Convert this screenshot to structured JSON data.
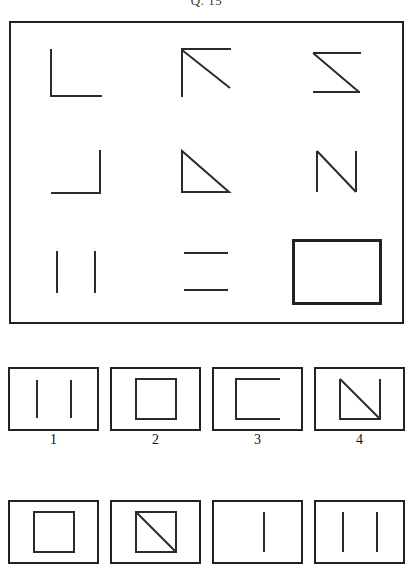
{
  "question": {
    "title": "Q. 15"
  },
  "matrix": {
    "rows": 3,
    "columns": 3,
    "cells": [
      {
        "position": "row1-col1",
        "name": "corner-bottom-left-shape",
        "description": "L shape: left vertical line and bottom horizontal line"
      },
      {
        "position": "row1-col2",
        "name": "corner-top-left-with-diagonal-shape",
        "description": "Left vertical line, top horizontal line and diagonal from top-left to bottom-right"
      },
      {
        "position": "row1-col3",
        "name": "z-shape",
        "description": "Top horizontal line, diagonal from top-left to bottom-right and bottom horizontal line"
      },
      {
        "position": "row2-col1",
        "name": "corner-bottom-right-shape",
        "description": "Right vertical line and bottom horizontal line"
      },
      {
        "position": "row2-col2",
        "name": "right-triangle-shape",
        "description": "Left vertical line, bottom horizontal line and diagonal hypotenuse"
      },
      {
        "position": "row2-col3",
        "name": "n-shape",
        "description": "Left vertical line, diagonal from top-left to bottom-right and right vertical line"
      },
      {
        "position": "row3-col1",
        "name": "two-vertical-lines-shape",
        "description": "Two parallel vertical lines"
      },
      {
        "position": "row3-col2",
        "name": "two-horizontal-lines-shape",
        "description": "Two parallel horizontal lines"
      },
      {
        "position": "row3-col3",
        "name": "rectangle-shape",
        "description": "Closed rectangle with four sides"
      }
    ]
  },
  "options": {
    "row_one": [
      {
        "label": "1",
        "name": "two-vertical-lines-shape",
        "description": "Two parallel vertical lines"
      },
      {
        "label": "2",
        "name": "square-shape",
        "description": "Closed square"
      },
      {
        "label": "3",
        "name": "c-shape",
        "description": "Rectangle open on the right side"
      },
      {
        "label": "4",
        "name": "triangle-with-diagonal-shape",
        "description": "Square outline with diagonal from top-left to bottom-right"
      }
    ],
    "row_two": [
      {
        "label": "",
        "name": "square-shape",
        "description": "Closed square"
      },
      {
        "label": "",
        "name": "square-with-diagonal-shape",
        "description": "Square with diagonal from top-left to bottom-right"
      },
      {
        "label": "",
        "name": "single-vertical-line-shape",
        "description": "One vertical line"
      },
      {
        "label": "",
        "name": "two-vertical-lines-shape",
        "description": "Two parallel vertical lines"
      }
    ]
  },
  "colors": {
    "stroke": "#2b2b2b",
    "border": "#222222",
    "background": "#ffffff"
  }
}
